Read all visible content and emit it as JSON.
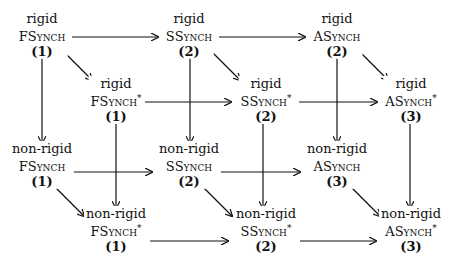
{
  "diagram": {
    "nodes": [
      {
        "id": "rigid-fsynch",
        "modifier": "rigid",
        "model_first": "F",
        "model_rest": "Synch",
        "star": "",
        "number": "(1)",
        "x": 42,
        "y": 35
      },
      {
        "id": "rigid-ssynch",
        "modifier": "rigid",
        "model_first": "S",
        "model_rest": "Synch",
        "star": "",
        "number": "(2)",
        "x": 189,
        "y": 35
      },
      {
        "id": "rigid-asynch",
        "modifier": "rigid",
        "model_first": "A",
        "model_rest": "Synch",
        "star": "",
        "number": "(2)",
        "x": 337,
        "y": 35
      },
      {
        "id": "rigid-fsynch-star",
        "modifier": "rigid",
        "model_first": "F",
        "model_rest": "Synch",
        "star": "*",
        "number": "(1)",
        "x": 116,
        "y": 100
      },
      {
        "id": "rigid-ssynch-star",
        "modifier": "rigid",
        "model_first": "S",
        "model_rest": "Synch",
        "star": "*",
        "number": "(2)",
        "x": 266,
        "y": 100
      },
      {
        "id": "rigid-asynch-star",
        "modifier": "rigid",
        "model_first": "A",
        "model_rest": "Synch",
        "star": "*",
        "number": "(3)",
        "x": 411,
        "y": 100
      },
      {
        "id": "nonrigid-fsynch",
        "modifier": "non-rigid",
        "model_first": "F",
        "model_rest": "Synch",
        "star": "",
        "number": "(1)",
        "x": 42,
        "y": 165
      },
      {
        "id": "nonrigid-ssynch",
        "modifier": "non-rigid",
        "model_first": "S",
        "model_rest": "Synch",
        "star": "",
        "number": "(2)",
        "x": 189,
        "y": 165
      },
      {
        "id": "nonrigid-asynch",
        "modifier": "non-rigid",
        "model_first": "A",
        "model_rest": "Synch",
        "star": "",
        "number": "(3)",
        "x": 337,
        "y": 165
      },
      {
        "id": "nonrigid-fsynch-star",
        "modifier": "non-rigid",
        "model_first": "F",
        "model_rest": "Synch",
        "star": "*",
        "number": "(1)",
        "x": 116,
        "y": 230
      },
      {
        "id": "nonrigid-ssynch-star",
        "modifier": "non-rigid",
        "model_first": "S",
        "model_rest": "Synch",
        "star": "*",
        "number": "(2)",
        "x": 266,
        "y": 230
      },
      {
        "id": "nonrigid-asynch-star",
        "modifier": "non-rigid",
        "model_first": "A",
        "model_rest": "Synch",
        "star": "*",
        "number": "(3)",
        "x": 411,
        "y": 230
      }
    ],
    "edges": [
      {
        "from": "rigid-fsynch",
        "to": "rigid-ssynch",
        "x1": 72,
        "y1": 37,
        "x2": 158,
        "y2": 37
      },
      {
        "from": "rigid-ssynch",
        "to": "rigid-asynch",
        "x1": 219,
        "y1": 37,
        "x2": 305,
        "y2": 37
      },
      {
        "from": "rigid-fsynch-star",
        "to": "rigid-ssynch-star",
        "x1": 145,
        "y1": 102,
        "x2": 231,
        "y2": 102
      },
      {
        "from": "rigid-ssynch-star",
        "to": "rigid-asynch-star",
        "x1": 299,
        "y1": 102,
        "x2": 377,
        "y2": 102
      },
      {
        "from": "nonrigid-fsynch",
        "to": "nonrigid-ssynch",
        "x1": 72,
        "y1": 172,
        "x2": 152,
        "y2": 172
      },
      {
        "from": "nonrigid-ssynch",
        "to": "nonrigid-asynch",
        "x1": 218,
        "y1": 172,
        "x2": 300,
        "y2": 172
      },
      {
        "from": "nonrigid-fsynch-star",
        "to": "nonrigid-ssynch-star",
        "x1": 150,
        "y1": 241,
        "x2": 228,
        "y2": 241
      },
      {
        "from": "nonrigid-ssynch-star",
        "to": "nonrigid-asynch-star",
        "x1": 300,
        "y1": 241,
        "x2": 376,
        "y2": 241
      },
      {
        "from": "rigid-fsynch",
        "to": "rigid-fsynch-star",
        "x1": 64,
        "y1": 52,
        "x2": 92,
        "y2": 80
      },
      {
        "from": "rigid-ssynch",
        "to": "rigid-ssynch-star",
        "x1": 212,
        "y1": 52,
        "x2": 240,
        "y2": 80
      },
      {
        "from": "rigid-asynch",
        "to": "rigid-asynch-star",
        "x1": 360,
        "y1": 52,
        "x2": 388,
        "y2": 80
      },
      {
        "from": "nonrigid-fsynch",
        "to": "nonrigid-fsynch-star",
        "x1": 56,
        "y1": 188,
        "x2": 84,
        "y2": 216
      },
      {
        "from": "nonrigid-ssynch",
        "to": "nonrigid-ssynch-star",
        "x1": 204,
        "y1": 188,
        "x2": 232,
        "y2": 216
      },
      {
        "from": "nonrigid-asynch",
        "to": "nonrigid-asynch-star",
        "x1": 352,
        "y1": 188,
        "x2": 380,
        "y2": 216
      },
      {
        "from": "rigid-fsynch",
        "to": "nonrigid-fsynch",
        "x1": 42,
        "y1": 58,
        "x2": 42,
        "y2": 143
      },
      {
        "from": "rigid-ssynch",
        "to": "nonrigid-ssynch",
        "x1": 190,
        "y1": 58,
        "x2": 190,
        "y2": 143
      },
      {
        "from": "rigid-asynch",
        "to": "nonrigid-asynch",
        "x1": 337,
        "y1": 58,
        "x2": 337,
        "y2": 143
      },
      {
        "from": "rigid-fsynch-star",
        "to": "nonrigid-fsynch-star",
        "x1": 116,
        "y1": 124,
        "x2": 116,
        "y2": 208
      },
      {
        "from": "rigid-ssynch-star",
        "to": "nonrigid-ssynch-star",
        "x1": 263,
        "y1": 124,
        "x2": 263,
        "y2": 208
      },
      {
        "from": "rigid-asynch-star",
        "to": "nonrigid-asynch-star",
        "x1": 410,
        "y1": 124,
        "x2": 410,
        "y2": 208
      }
    ]
  }
}
